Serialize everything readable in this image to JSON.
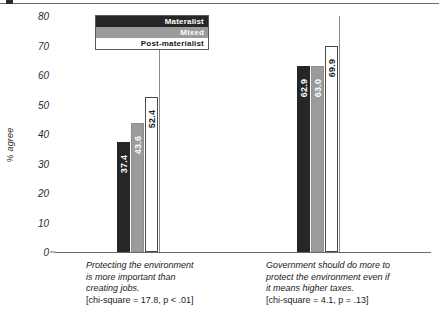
{
  "chart_data": {
    "type": "bar",
    "title": "",
    "subtitle": "",
    "xlabel": "",
    "ylabel": "% agree",
    "ylim": [
      0,
      80
    ],
    "ytick_step": 10,
    "yticks": [
      80,
      70,
      60,
      50,
      40,
      30,
      20,
      10,
      0
    ],
    "grid": false,
    "legend_position": "top-left-inside",
    "categories": [
      "Protecting the environment is more important than creating jobs.",
      "Government should do more to protect the environment even if it means higher taxes."
    ],
    "series": [
      {
        "name": "Materalist",
        "color": "#262626",
        "values": [
          37.4,
          62.9
        ]
      },
      {
        "name": "Mixed",
        "color": "#9b9b9b",
        "values": [
          43.6,
          63.0
        ]
      },
      {
        "name": "Post-materialist",
        "color": "#ffffff",
        "values": [
          52.4,
          69.9
        ]
      }
    ],
    "annotations": [
      "[chi-square = 17.8, p < .01]",
      "[chi-square = 4.1, p = .13]"
    ]
  },
  "legend": {
    "items": [
      {
        "label": "Materalist"
      },
      {
        "label": "Mixed"
      },
      {
        "label": "Post-materialist"
      }
    ]
  },
  "axis": {
    "y_label": "% agree",
    "y_ticks": [
      "80",
      "70",
      "60",
      "50",
      "40",
      "30",
      "20",
      "10",
      "0"
    ]
  },
  "groups": [
    {
      "caption_lines": [
        "Protecting the environment",
        "is more important than",
        "creating jobs."
      ],
      "stat": "[chi-square = 17.8, p < .01]",
      "bars": [
        {
          "series": "Materalist",
          "value": 37.4,
          "label": "37.4"
        },
        {
          "series": "Mixed",
          "value": 43.6,
          "label": "43.6"
        },
        {
          "series": "Post-materialist",
          "value": 52.4,
          "label": "52.4"
        }
      ]
    },
    {
      "caption_lines": [
        "Government should do more to",
        "protect the environment even if",
        "it means higher taxes."
      ],
      "stat": "[chi-square = 4.1, p = .13]",
      "bars": [
        {
          "series": "Materalist",
          "value": 62.9,
          "label": "62.9"
        },
        {
          "series": "Mixed",
          "value": 63.0,
          "label": "63.0"
        },
        {
          "series": "Post-materialist",
          "value": 69.9,
          "label": "69.9"
        }
      ]
    }
  ]
}
